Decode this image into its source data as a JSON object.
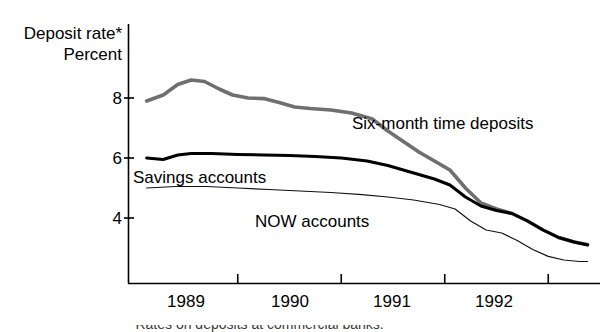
{
  "chart_data": {
    "type": "line",
    "title": "Deposit rate*",
    "subtitle": "Percent",
    "xlabel": "",
    "ylabel": "Percent",
    "ylim": [
      2.4,
      9.2
    ],
    "xlim": [
      1988.6,
      1992.9
    ],
    "grid": false,
    "legend_position": "inline-annotations",
    "yticks": [
      8,
      6,
      4
    ],
    "ytick_labels": [
      "8",
      "6",
      "4"
    ],
    "xticks": [
      1989,
      1990,
      1991,
      1992
    ],
    "xtick_labels": [
      "1989",
      "1990",
      "1991",
      "1992"
    ],
    "footnote": "*Rates on deposits at commercial banks.",
    "series": [
      {
        "name": "Six-month time deposits",
        "color": "#6f6f6f",
        "width": 3.6,
        "x": [
          1988.62,
          1988.78,
          1988.92,
          1989.05,
          1989.18,
          1989.32,
          1989.45,
          1989.6,
          1989.75,
          1989.9,
          1990.05,
          1990.2,
          1990.4,
          1990.6,
          1990.8,
          1990.95,
          1991.1,
          1991.25,
          1991.4,
          1991.55,
          1991.7,
          1991.85,
          1992.0,
          1992.15,
          1992.3,
          1992.45,
          1992.6,
          1992.75,
          1992.88
        ],
        "values": [
          7.9,
          8.1,
          8.45,
          8.6,
          8.55,
          8.3,
          8.1,
          8.0,
          7.98,
          7.85,
          7.7,
          7.65,
          7.6,
          7.5,
          7.3,
          6.9,
          6.55,
          6.2,
          5.9,
          5.6,
          5.0,
          4.5,
          4.3,
          4.15,
          3.9,
          3.6,
          3.35,
          3.2,
          3.12
        ]
      },
      {
        "name": "Savings accounts",
        "color": "#000000",
        "width": 3.0,
        "x": [
          1988.62,
          1988.78,
          1988.92,
          1989.05,
          1989.25,
          1989.5,
          1989.75,
          1990.0,
          1990.25,
          1990.5,
          1990.75,
          1990.95,
          1991.1,
          1991.25,
          1991.4,
          1991.55,
          1991.7,
          1991.85,
          1992.0,
          1992.15,
          1992.3,
          1992.45,
          1992.6,
          1992.75,
          1992.88
        ],
        "values": [
          6.0,
          5.95,
          6.1,
          6.15,
          6.15,
          6.12,
          6.1,
          6.08,
          6.05,
          6.0,
          5.9,
          5.75,
          5.6,
          5.45,
          5.3,
          5.1,
          4.7,
          4.4,
          4.25,
          4.15,
          3.9,
          3.6,
          3.35,
          3.2,
          3.1
        ]
      },
      {
        "name": "NOW accounts",
        "color": "#111111",
        "width": 1.2,
        "x": [
          1988.62,
          1988.9,
          1989.2,
          1989.5,
          1989.8,
          1990.1,
          1990.4,
          1990.7,
          1990.95,
          1991.2,
          1991.45,
          1991.6,
          1991.75,
          1991.9,
          1992.05,
          1992.2,
          1992.35,
          1992.5,
          1992.65,
          1992.8,
          1992.88
        ],
        "values": [
          5.0,
          5.05,
          5.05,
          5.0,
          4.95,
          4.9,
          4.85,
          4.78,
          4.7,
          4.6,
          4.45,
          4.3,
          3.9,
          3.6,
          3.5,
          3.25,
          2.95,
          2.72,
          2.6,
          2.55,
          2.55
        ]
      }
    ]
  },
  "labels": {
    "title_deposit_rate": "Deposit rate*",
    "title_percent": "Percent",
    "series_six_month": "Six-month time deposits",
    "series_savings": "Savings accounts",
    "series_now": "NOW accounts",
    "ytick_8": "8",
    "ytick_6": "6",
    "ytick_4": "4",
    "xtick_1989": "1989",
    "xtick_1990": "1990",
    "xtick_1991": "1991",
    "xtick_1992": "1992",
    "footnote": "*Rates on deposits at commercial banks."
  }
}
